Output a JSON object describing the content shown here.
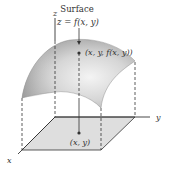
{
  "diagram": {
    "title_line1": "Surface",
    "title_line2": "z = f(x, y)",
    "point_3d_label": "(x, y, f(x, y))",
    "point_2d_label": "(x, y)",
    "axes": {
      "x": "x",
      "y": "y",
      "z": "z"
    },
    "colors": {
      "surface_light": "#f2f2f2",
      "surface_dark": "#9a9a9a",
      "base_plane": "#dedede",
      "lines": "#333333"
    }
  }
}
